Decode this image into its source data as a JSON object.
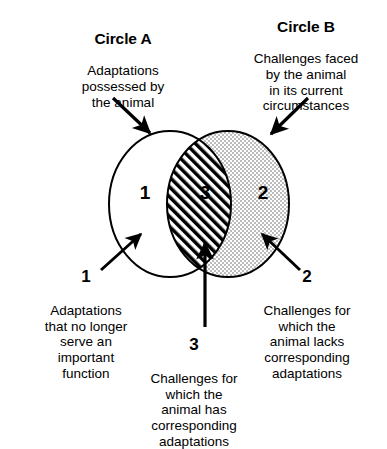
{
  "diagram": {
    "type": "venn-2-circle",
    "title_a": "Circle A",
    "title_b": "Circle B",
    "description_a": "Adaptations\npossessed by\nthe animal",
    "description_b": "Challenges faced\nby the animal\nin its current\ncircumstances",
    "regions": [
      {
        "id": "1",
        "number": "1",
        "fill": "white",
        "label": "Adaptations\nthat no longer\nserve an\nimportant\nfunction"
      },
      {
        "id": "3",
        "number": "3",
        "fill": "diagonal-hatch",
        "label": "Challenges for\nwhich the\nanimal has\ncorresponding\nadaptations"
      },
      {
        "id": "2",
        "number": "2",
        "fill": "stipple-dots",
        "label": "Challenges for\nwhich the\nanimal lacks\ncorresponding\nadaptations"
      }
    ],
    "colors": {
      "ink": "#000000",
      "background": "#ffffff",
      "stipple": "#5a5a5a"
    },
    "arrows": [
      {
        "name": "arrow-to-circle-a",
        "direction": "down-right"
      },
      {
        "name": "arrow-to-circle-b",
        "direction": "down-left"
      },
      {
        "name": "arrow-to-region-1",
        "direction": "up-right"
      },
      {
        "name": "arrow-to-region-2",
        "direction": "up-left"
      },
      {
        "name": "arrow-to-region-3",
        "direction": "up"
      }
    ]
  }
}
